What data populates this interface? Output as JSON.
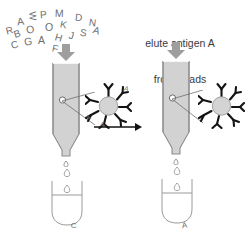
{
  "diagram": {
    "title_caption": "elute antigen A\nfrom beads",
    "caption_lines": [
      "elute antigen A",
      "from beads"
    ],
    "colors": {
      "column_fill": "#d2d2d2",
      "column_outline": "#8d8d8d",
      "arrow_gray": "#a8a8a8",
      "bead_fill": "#d0d0d0",
      "antibody_black": "#1a1a1a",
      "text_gray": "#6e6e70",
      "caption_gray": "#3a3a3c",
      "process_arrow": "#111111"
    },
    "scattered_letters": [
      {
        "ch": "R",
        "x": 6,
        "y": 26,
        "rot": -14,
        "size": 10
      },
      {
        "ch": "A",
        "x": 17,
        "y": 16,
        "rot": -8,
        "size": 10.5
      },
      {
        "ch": "W",
        "x": 28,
        "y": 11,
        "rot": 86,
        "size": 9.5
      },
      {
        "ch": "P",
        "x": 40,
        "y": 10,
        "rot": -4,
        "size": 10
      },
      {
        "ch": "M",
        "x": 55,
        "y": 8,
        "rot": 2,
        "size": 10.5
      },
      {
        "ch": "D",
        "x": 75,
        "y": 13,
        "rot": 6,
        "size": 10
      },
      {
        "ch": "N",
        "x": 89,
        "y": 18,
        "rot": 8,
        "size": 10
      },
      {
        "ch": "B",
        "x": 14,
        "y": 29,
        "rot": -18,
        "size": 10
      },
      {
        "ch": "O",
        "x": 26,
        "y": 24,
        "rot": -6,
        "size": 10.5
      },
      {
        "ch": "O",
        "x": 45,
        "y": 22,
        "rot": 0,
        "size": 10.5
      },
      {
        "ch": "K",
        "x": 60,
        "y": 20,
        "rot": 12,
        "size": 10
      },
      {
        "ch": "C",
        "x": 11,
        "y": 40,
        "rot": -16,
        "size": 10
      },
      {
        "ch": "G",
        "x": 24,
        "y": 36,
        "rot": -6,
        "size": 10.5
      },
      {
        "ch": "A",
        "x": 38,
        "y": 35,
        "rot": 0,
        "size": 10.5
      },
      {
        "ch": "H",
        "x": 55,
        "y": 33,
        "rot": 16,
        "size": 10
      },
      {
        "ch": "J",
        "x": 69,
        "y": 31,
        "rot": 14,
        "size": 10
      },
      {
        "ch": "S",
        "x": 80,
        "y": 28,
        "rot": 10,
        "size": 10
      },
      {
        "ch": "A",
        "x": 93,
        "y": 26,
        "rot": 18,
        "size": 10
      },
      {
        "ch": "F",
        "x": 52,
        "y": 44,
        "rot": 12,
        "size": 10
      },
      {
        "ch": "L",
        "x": 66,
        "y": 46,
        "rot": 14,
        "size": 10
      }
    ],
    "left_stage": {
      "name": "load-sample-onto-column",
      "down_arrow": true,
      "bead_antigens": [
        "A",
        "A",
        "A"
      ],
      "bead_has_bound_antigen": true,
      "tube_letters": [
        [
          "C",
          "K"
        ],
        [
          "R",
          "N"
        ],
        [
          "etc"
        ]
      ]
    },
    "right_stage": {
      "name": "elute-antigen-from-column",
      "down_arrow": true,
      "bead_antigens": [],
      "bead_has_bound_antigen": false,
      "tube_letters": [
        [
          "A",
          "A"
        ],
        [
          "A"
        ]
      ]
    },
    "process_arrow": {
      "name": "elution-step-arrow",
      "direction": "right"
    }
  }
}
